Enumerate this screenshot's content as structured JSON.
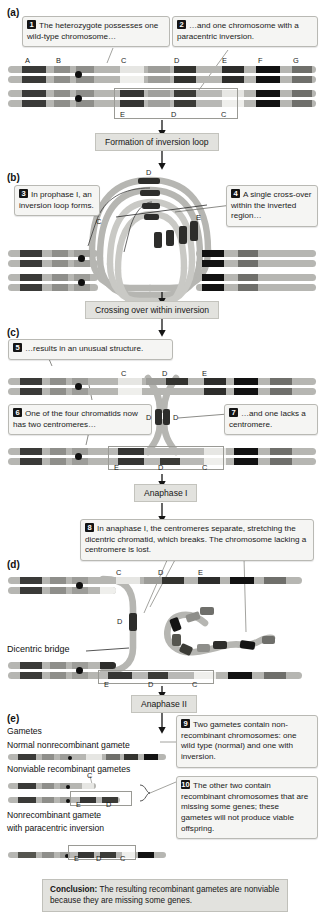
{
  "figure": {
    "panels": [
      "(a)",
      "(b)",
      "(c)",
      "(d)",
      "(e)"
    ]
  },
  "colors": {
    "chromatid_body": "#b6b6b2",
    "band_dark": "#2c2c2c",
    "band_mid": "#6e6e6a",
    "band_light": "#d8d8d4",
    "band_pale": "#ececea",
    "centromere": "#0e0e0e",
    "callout_bg": "#f5f5f3",
    "callout_border": "#b9b9b4",
    "stage_bg": "#e2e2de",
    "text": "#1a1a1a"
  },
  "panel_a": {
    "letter": "(a)",
    "callouts": [
      {
        "num": "1",
        "text": "The heterozygote possesses one wild-type chromosome…"
      },
      {
        "num": "2",
        "text": "…and one chromosome with a paracentric inversion."
      }
    ],
    "gene_labels_top": [
      "A",
      "B",
      "C",
      "D",
      "E",
      "F",
      "G"
    ],
    "gene_labels_inverted": [
      "E",
      "D",
      "C"
    ],
    "stage_label": "Formation of inversion loop"
  },
  "panel_b": {
    "letter": "(b)",
    "callouts": [
      {
        "num": "3",
        "text": "In prophase I, an inversion loop forms."
      },
      {
        "num": "4",
        "text": "A single cross-over within the inverted region…"
      }
    ],
    "loop_labels": [
      "C",
      "D",
      "E"
    ],
    "stage_label": "Crossing over within inversion"
  },
  "panel_c": {
    "letter": "(c)",
    "callouts": [
      {
        "num": "5",
        "text": "…results in an unusual structure."
      },
      {
        "num": "6",
        "text": "One of the four chromatids now has two centromeres…"
      },
      {
        "num": "7",
        "text": "…and one lacks a centromere."
      }
    ],
    "gene_labels_top": [
      "C",
      "D",
      "E"
    ],
    "bridge_labels": [
      "D",
      "D"
    ],
    "gene_labels_inverted": [
      "E",
      "D",
      "C"
    ],
    "stage_label": "Anaphase I"
  },
  "panel_d": {
    "letter": "(d)",
    "callouts": [
      {
        "num": "8",
        "text": "In anaphase I, the centromeres separate, stretching the dicentric chromatid, which breaks. The chromosome lacking a centromere is lost."
      }
    ],
    "gene_labels_top": [
      "C",
      "D",
      "E"
    ],
    "bridge_gene_label": "D",
    "bridge_label": "Dicentric bridge",
    "gene_labels_inverted": [
      "E",
      "D",
      "C"
    ],
    "stage_label": "Anaphase II"
  },
  "panel_e": {
    "letter": "(e)",
    "heading": "Gametes",
    "gamete_labels": [
      "Normal nonrecombinant gamete",
      "Nonviable recombinant gametes",
      "Nonrecombinant gamete with paracentric inversion"
    ],
    "callouts": [
      {
        "num": "9",
        "text": "Two gametes contain non-recombinant chromosomes: one wild type (normal) and one with inversion."
      },
      {
        "num": "10",
        "text": "The other two contain recombinant chromosomes that are missing some genes; these gametes will not produce viable offspring."
      }
    ],
    "gene_labels_recomb_top": [
      "C"
    ],
    "gene_labels_recomb_bottom": [
      "E",
      "D"
    ],
    "gene_labels_inversion": [
      "E",
      "D",
      "C"
    ]
  },
  "conclusion": {
    "lead": "Conclusion:",
    "text": " The resulting recombinant gametes are nonviable because they are missing some genes."
  }
}
